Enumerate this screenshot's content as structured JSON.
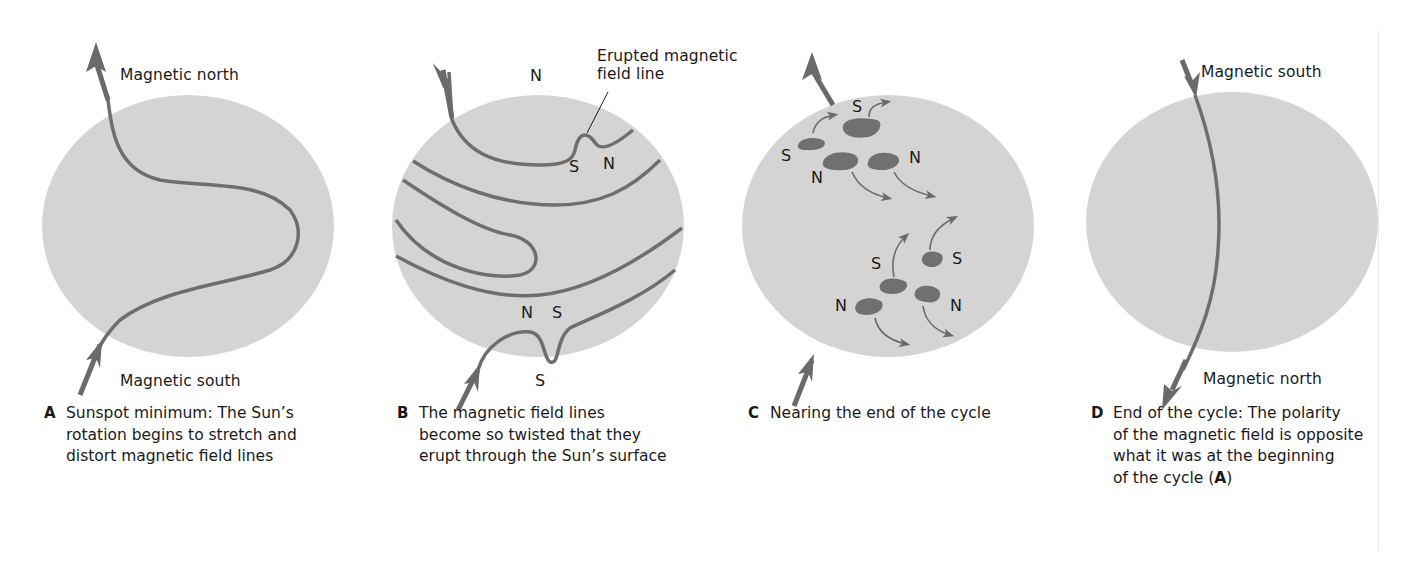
{
  "figure": {
    "panels": [
      {
        "id": "A",
        "top_label": "Magnetic north",
        "bottom_label": "Magnetic south",
        "caption_letter": "A",
        "caption": "Sunspot minimum: The Sun’s\nrotation begins to stretch and\ndistort magnetic field lines"
      },
      {
        "id": "B",
        "top_pole": "N",
        "bottom_pole": "S",
        "callout": "Erupted magnetic\nfield line",
        "upper_loop": {
          "left": "S",
          "right": "N"
        },
        "lower_loop": {
          "left": "N",
          "right": "S"
        },
        "caption_letter": "B",
        "caption": "The magnetic field lines\nbecome so twisted that they\nerupt through the Sun’s surface"
      },
      {
        "id": "C",
        "spot_labels": {
          "top_s": "S",
          "left_s": "S",
          "upper_n_left": "N",
          "upper_n_right": "N",
          "lower_s_left": "S",
          "lower_s_right": "S",
          "lower_n_left": "N",
          "lower_n_right": "N"
        },
        "caption_letter": "C",
        "caption": "Nearing the end of the cycle"
      },
      {
        "id": "D",
        "top_label": "Magnetic south",
        "bottom_label": "Magnetic north",
        "caption_letter": "D",
        "caption_pre": "End of the cycle: The polarity\nof the magnetic field is opposite\nwhat it was at the beginning\nof the cycle (",
        "caption_ref": "A",
        "caption_post": ")"
      }
    ],
    "colors": {
      "sun_disk": "#d4d4d4",
      "field_line": "#6e6e6e",
      "arrow": "#6a6a6a",
      "sunspot": "#707070",
      "text": "#1a1a1a"
    }
  }
}
